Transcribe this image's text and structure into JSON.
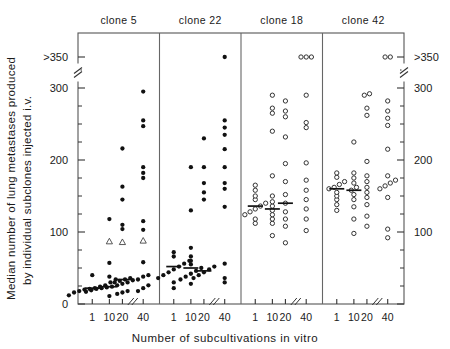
{
  "figure": {
    "ylabel_line1": "Median number of lung metastases produced",
    "ylabel_line2": "by individual subclones injected i.v.",
    "xlabel": "Number of subcultivations in vitro"
  },
  "chart_data": {
    "type": "scatter",
    "title": "",
    "xlabel": "Number of subcultivations in vitro",
    "ylabel": "Median number of lung metastases produced by individual subclones injected i.v.",
    "ylim": [
      0,
      350
    ],
    "yticks_major": [
      0,
      100,
      200,
      300
    ],
    "yticks_major_labels": [
      "0",
      "100",
      "200",
      "300"
    ],
    "ytick_top_label": ">350",
    "yticks_minor": [
      25,
      50,
      75,
      125,
      150,
      175,
      225,
      250,
      275,
      325
    ],
    "y_axis_break": true,
    "y_axis_break_between": [
      300,
      350
    ],
    "grid": false,
    "legend": null,
    "xticks": [
      1,
      10,
      20,
      40
    ],
    "xtick_labels": [
      "1",
      "10",
      "20",
      "40"
    ],
    "x_axis_break_between": [
      20,
      40
    ],
    "marker_styles": {
      "filled-circle": "#111111",
      "open-circle": "#333333",
      "open-triangle": "#333333"
    },
    "panels": [
      {
        "label": "clone 5",
        "marker": "filled-circle",
        "groups": [
          {
            "x": 1,
            "values": [
              12,
              16,
              18,
              20,
              21,
              22,
              24,
              26,
              30,
              34,
              40
            ],
            "median": 22,
            "special": []
          },
          {
            "x": 10,
            "values": [
              11,
              17,
              19,
              21,
              22,
              23,
              24,
              26,
              28,
              30,
              33,
              38,
              57,
              87,
              118
            ],
            "median": 24,
            "special": [
              {
                "value": 87,
                "marker": "open-triangle"
              }
            ]
          },
          {
            "x": 20,
            "values": [
              14,
              16,
              18,
              30,
              32,
              34,
              36,
              86,
              104,
              110,
              145,
              163,
              216
            ],
            "median": 34,
            "special": [
              {
                "value": 86,
                "marker": "open-triangle"
              }
            ]
          },
          {
            "x": 40,
            "values": [
              18,
              22,
              26,
              34,
              38,
              40,
              58,
              88,
              103,
              115,
              175,
              182,
              190,
              247,
              255,
              295
            ],
            "median": null,
            "special": [
              {
                "value": 88,
                "marker": "open-triangle"
              }
            ]
          }
        ]
      },
      {
        "label": "clone 22",
        "marker": "filled-circle",
        "groups": [
          {
            "x": 1,
            "values": [
              22,
              30,
              36,
              40,
              44,
              48,
              52,
              56,
              60,
              66,
              72
            ],
            "median": 52,
            "special": []
          },
          {
            "x": 10,
            "values": [
              28,
              34,
              38,
              42,
              46,
              50,
              55,
              60,
              66,
              78,
              130,
              190
            ],
            "median": 50,
            "special": []
          },
          {
            "x": 20,
            "values": [
              36,
              40,
              44,
              48,
              52,
              145,
              155,
              168,
              190,
              230
            ],
            "median": 46,
            "special": []
          },
          {
            "x": 40,
            "values": [
              30,
              36,
              56,
              135,
              160,
              168,
              190,
              215,
              235,
              245,
              255,
              350
            ],
            "median": null,
            "special": []
          }
        ]
      },
      {
        "label": "clone 18",
        "marker": "open-circle",
        "groups": [
          {
            "x": 1,
            "values": [
              112,
              118,
              124,
              128,
              132,
              136,
              140,
              145,
              150,
              158,
              165
            ],
            "median": 136,
            "special": []
          },
          {
            "x": 10,
            "values": [
              95,
              112,
              118,
              124,
              130,
              136,
              142,
              150,
              178,
              240,
              265,
              272,
              290
            ],
            "median": 132,
            "special": []
          },
          {
            "x": 20,
            "values": [
              85,
              108,
              118,
              128,
              140,
              152,
              170,
              195,
              232,
              260,
              268,
              282
            ],
            "median": 140,
            "special": []
          },
          {
            "x": 40,
            "values": [
              102,
              118,
              132,
              145,
              158,
              172,
              196,
              245,
              252,
              290,
              355,
              355,
              355
            ],
            "median": null,
            "special": []
          }
        ]
      },
      {
        "label": "clone 42",
        "marker": "open-circle",
        "groups": [
          {
            "x": 1,
            "values": [
              130,
              138,
              145,
              150,
              155,
              160,
              162,
              166,
              170,
              176,
              182
            ],
            "median": 160,
            "special": []
          },
          {
            "x": 10,
            "values": [
              98,
              118,
              135,
              145,
              152,
              158,
              162,
              168,
              175,
              182,
              225
            ],
            "median": 158,
            "special": []
          },
          {
            "x": 20,
            "values": [
              108,
              122,
              138,
              148,
              155,
              162,
              170,
              178,
              198,
              262,
              272,
              290,
              292
            ],
            "median": null,
            "special": []
          },
          {
            "x": 40,
            "values": [
              92,
              104,
              148,
              160,
              164,
              168,
              172,
              178,
              215,
              248,
              258,
              268,
              282,
              355,
              355
            ],
            "median": null,
            "special": []
          }
        ]
      }
    ]
  }
}
